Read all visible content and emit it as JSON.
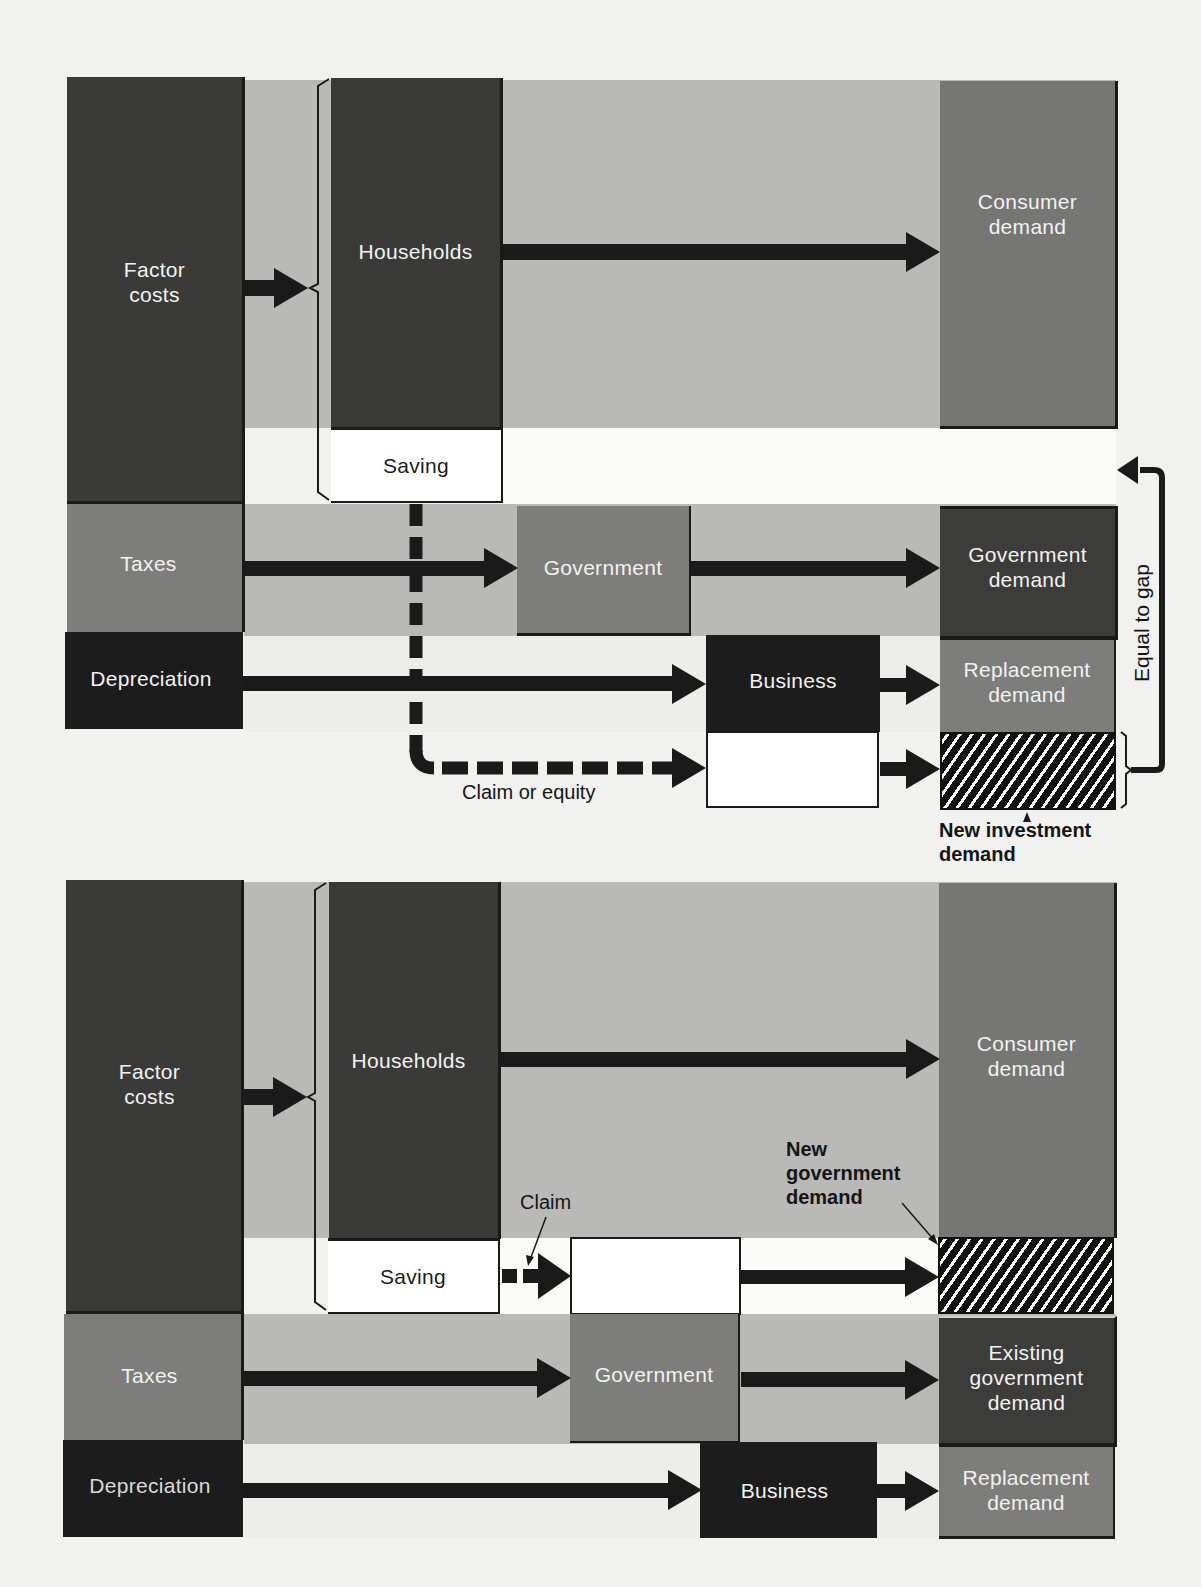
{
  "diagram_top": {
    "sources": {
      "factor_costs": "Factor\ncosts",
      "taxes": "Taxes",
      "depreciation": "Depreciation"
    },
    "intermediaries": {
      "households": "Households",
      "saving": "Saving",
      "government": "Government",
      "business": "Business"
    },
    "demands": {
      "consumer": "Consumer\ndemand",
      "government": "Government\ndemand",
      "replacement": "Replacement\ndemand",
      "new_investment": "New investment\ndemand"
    },
    "annotations": {
      "claim_or_equity": "Claim or equity",
      "equal_to_gap": "Equal to gap"
    }
  },
  "diagram_bottom": {
    "sources": {
      "factor_costs": "Factor\ncosts",
      "taxes": "Taxes",
      "depreciation": "Depreciation"
    },
    "intermediaries": {
      "households": "Households",
      "saving": "Saving",
      "government": "Government",
      "business": "Business"
    },
    "demands": {
      "consumer": "Consumer\ndemand",
      "new_government": "New\ngovernment\ndemand",
      "existing_government": "Existing\ngovernment\ndemand",
      "replacement": "Replacement\ndemand"
    },
    "annotations": {
      "claim": "Claim"
    }
  },
  "colors": {
    "background": "#f1f1ef",
    "band_gray": "#b9b9b7",
    "dark_block": "#3a3a39",
    "black_block": "#1c1c1c",
    "mid_block": "#7d7d7b",
    "arrow": "#1a1a1a"
  }
}
